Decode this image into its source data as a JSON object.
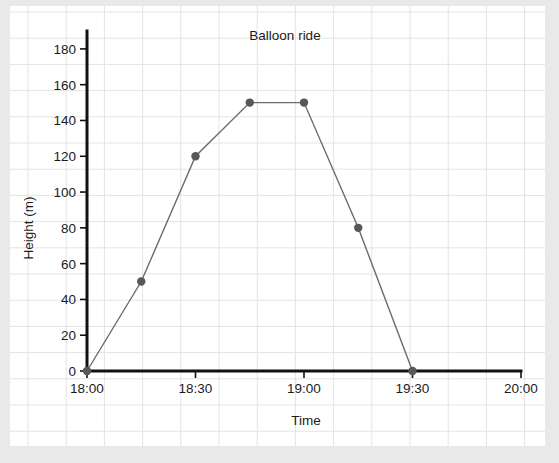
{
  "chart_data": {
    "type": "line",
    "title": "Balloon ride",
    "xlabel": "Time",
    "ylabel": "Height (m)",
    "x_tick_labels": [
      "18:00",
      "18:30",
      "19:00",
      "19:30",
      "20:00"
    ],
    "x_tick_values": [
      0,
      30,
      60,
      90,
      120
    ],
    "y_tick_labels": [
      "0",
      "20",
      "40",
      "60",
      "80",
      "100",
      "120",
      "140",
      "160",
      "180"
    ],
    "y_tick_values": [
      0,
      20,
      40,
      60,
      80,
      100,
      120,
      140,
      160,
      180
    ],
    "xlim": [
      0,
      120
    ],
    "ylim": [
      0,
      190
    ],
    "grid": true,
    "legend": "none",
    "series": [
      {
        "name": "Balloon height",
        "x_labels": [
          "18:00",
          "18:15",
          "18:30",
          "18:45",
          "19:00",
          "19:15",
          "19:30"
        ],
        "x": [
          0,
          15,
          30,
          45,
          60,
          75,
          90
        ],
        "values": [
          0,
          50,
          120,
          150,
          150,
          80,
          0
        ],
        "marker_color": "#585858",
        "line_color": "#6b6b6b"
      }
    ]
  },
  "colors": {
    "page_background": "#e9e9e9",
    "paper_background": "#ffffff",
    "grid_line": "#e4e4e4",
    "axis": "#111111",
    "text": "#1b1b1b"
  }
}
